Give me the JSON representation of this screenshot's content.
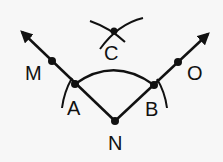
{
  "diagram": {
    "type": "geometric-construction",
    "colors": {
      "background": "#f7f7f7",
      "stroke": "#111111"
    },
    "points": {
      "A": {
        "label": "A",
        "x": 75,
        "y": 84
      },
      "B": {
        "label": "B",
        "x": 154,
        "y": 85
      },
      "N": {
        "label": "N",
        "x": 115,
        "y": 121
      },
      "C": {
        "label": "C",
        "x": 114,
        "y": 31
      },
      "M": {
        "label": "M",
        "x": 52,
        "y": 61
      },
      "O": {
        "label": "O",
        "x": 178,
        "y": 62
      }
    },
    "rays": [
      {
        "name": "ray-NM",
        "from": "N",
        "through": "M"
      },
      {
        "name": "ray-NO",
        "from": "N",
        "through": "O"
      }
    ],
    "arcs": [
      {
        "name": "arc-AB",
        "center": "N"
      },
      {
        "name": "arc-at-A"
      },
      {
        "name": "arc-at-B"
      },
      {
        "name": "arc-C-left"
      },
      {
        "name": "arc-C-right"
      }
    ]
  }
}
